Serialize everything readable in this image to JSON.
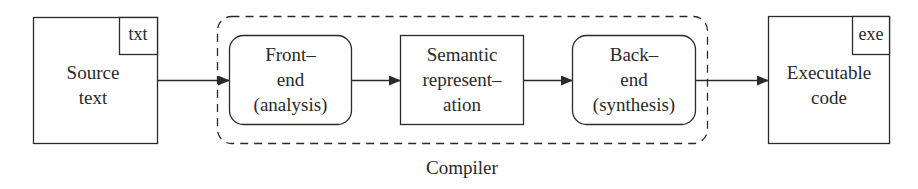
{
  "diagram": {
    "nodes": {
      "source": {
        "label_line1": "Source",
        "label_line2": "text",
        "tag": "txt"
      },
      "frontend": {
        "line1": "Front–",
        "line2": "end",
        "line3": "(analysis)"
      },
      "semantic": {
        "line1": "Semantic",
        "line2": "represent–",
        "line3": "ation"
      },
      "backend": {
        "line1": "Back–",
        "line2": "end",
        "line3": "(synthesis)"
      },
      "executable": {
        "label_line1": "Executable",
        "label_line2": "code",
        "tag": "exe"
      }
    },
    "group_label": "Compiler",
    "edges": [
      {
        "from": "source",
        "to": "frontend"
      },
      {
        "from": "frontend",
        "to": "semantic"
      },
      {
        "from": "semantic",
        "to": "backend"
      },
      {
        "from": "backend",
        "to": "executable"
      }
    ],
    "colors": {
      "stroke": "#2a2a2a",
      "background": "#ffffff"
    }
  }
}
